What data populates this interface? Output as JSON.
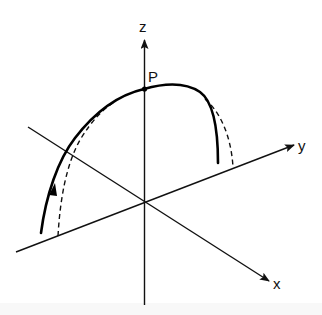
{
  "diagram": {
    "title": "",
    "axes": {
      "x": {
        "label": "x"
      },
      "y": {
        "label": "y"
      },
      "z": {
        "label": "z"
      }
    },
    "points": [
      {
        "label": "P",
        "description": "point on z-axis where curve crosses"
      }
    ],
    "curves": [
      {
        "name": "trajectory",
        "style": "solid",
        "has_direction_arrow": true
      },
      {
        "name": "projection",
        "style": "dashed"
      }
    ],
    "colors": {
      "ink": "#111111",
      "background": "#ffffff"
    }
  }
}
